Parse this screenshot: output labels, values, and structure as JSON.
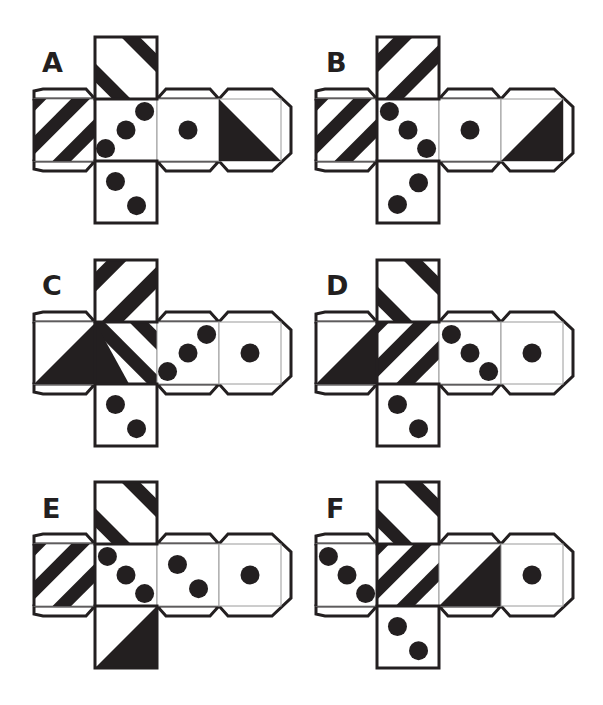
{
  "puzzle": {
    "title": "Cube nets",
    "colors": {
      "ink": "#231f20",
      "paper": "#ffffff",
      "fold_line": "#9a9a9a"
    },
    "nets": [
      {
        "label": "A",
        "faces": {
          "top": {
            "pattern": "stripes-backslash-two"
          },
          "left": {
            "pattern": "stripes-slash-three"
          },
          "center": {
            "pattern": "dots-3-slash"
          },
          "right1": {
            "pattern": "dot-1"
          },
          "right2": {
            "pattern": "triangle-lower-left-dark"
          },
          "bottom": {
            "pattern": "dots-2-backslash"
          }
        }
      },
      {
        "label": "B",
        "faces": {
          "top": {
            "pattern": "stripes-slash-two"
          },
          "left": {
            "pattern": "stripes-slash-three"
          },
          "center": {
            "pattern": "dots-3-backslash"
          },
          "right1": {
            "pattern": "dot-1"
          },
          "right2": {
            "pattern": "triangle-lower-right-dark"
          },
          "bottom": {
            "pattern": "dots-2-slash"
          }
        }
      },
      {
        "label": "C",
        "faces": {
          "top": {
            "pattern": "stripes-slash-two-c"
          },
          "left": {
            "pattern": "triangle-lower-right-dark"
          },
          "center": {
            "pattern": "stripes-backslash-c"
          },
          "right1": {
            "pattern": "dots-3-slash"
          },
          "right2": {
            "pattern": "dot-1"
          },
          "bottom": {
            "pattern": "dots-2-backslash"
          }
        }
      },
      {
        "label": "D",
        "faces": {
          "top": {
            "pattern": "stripes-backslash-two"
          },
          "left": {
            "pattern": "triangle-lower-right-dark"
          },
          "center": {
            "pattern": "stripes-slash-three"
          },
          "right1": {
            "pattern": "dots-3-backslash"
          },
          "right2": {
            "pattern": "dot-1"
          },
          "bottom": {
            "pattern": "dots-2-backslash"
          }
        }
      },
      {
        "label": "E",
        "faces": {
          "top": {
            "pattern": "stripes-backslash-two"
          },
          "left": {
            "pattern": "stripes-slash-three"
          },
          "center": {
            "pattern": "dots-3-backslash"
          },
          "right1": {
            "pattern": "dots-2-backslash"
          },
          "right2": {
            "pattern": "dot-1"
          },
          "bottom": {
            "pattern": "triangle-lower-right-dark"
          }
        }
      },
      {
        "label": "F",
        "faces": {
          "top": {
            "pattern": "stripes-backslash-two"
          },
          "left": {
            "pattern": "dots-3-backslash"
          },
          "center": {
            "pattern": "stripes-slash-three"
          },
          "right1": {
            "pattern": "triangle-lower-right-dark"
          },
          "right2": {
            "pattern": "dot-1"
          },
          "bottom": {
            "pattern": "dots-2-backslash"
          }
        }
      }
    ]
  }
}
